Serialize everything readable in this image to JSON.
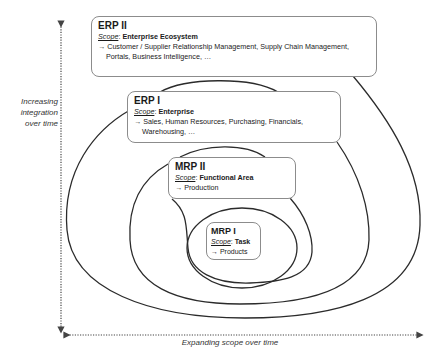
{
  "diagram": {
    "type": "nested-scope-diagram",
    "levels": [
      {
        "id": "erp2",
        "title": "ERP II",
        "scope_label": "Scope",
        "scope_value": "Enterprise Ecosystem",
        "items": "→ Customer / Supplier Relationship Management, Supply Chain Management, Portals, Business Intelligence, …"
      },
      {
        "id": "erp1",
        "title": "ERP I",
        "scope_label": "Scope",
        "scope_value": "Enterprise",
        "items": "→ Sales, Human Resources, Purchasing, Financials, Warehousing, …"
      },
      {
        "id": "mrp2",
        "title": "MRP II",
        "scope_label": "Scope",
        "scope_value": "Functional Area",
        "items": "→ Production"
      },
      {
        "id": "mrp1",
        "title": "MRP I",
        "scope_label": "Scope",
        "scope_value": "Task",
        "items": "→ Products"
      }
    ],
    "axes": {
      "y_label": "Increasing integration over time",
      "x_label": "Expanding scope over time"
    },
    "colors": {
      "line": "#2b2b2b",
      "box_border": "#8c8c8c",
      "arrow": "#444444"
    }
  }
}
